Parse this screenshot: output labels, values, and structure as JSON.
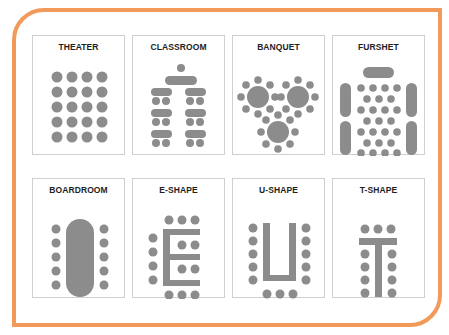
{
  "diagram": {
    "colors": {
      "frame": "#f19a5a",
      "shape": "#8c8c8c",
      "panel_border": "#cfcfcf",
      "title": "#1e1e1e"
    },
    "panels": [
      {
        "id": "theater",
        "title": "THEATER"
      },
      {
        "id": "classroom",
        "title": "CLASSROOM"
      },
      {
        "id": "banquet",
        "title": "BANQUET"
      },
      {
        "id": "furshet",
        "title": "FURSHET"
      },
      {
        "id": "boardroom",
        "title": "BOARDROOM"
      },
      {
        "id": "e-shape",
        "title": "E-SHAPE"
      },
      {
        "id": "u-shape",
        "title": "U-SHAPE"
      },
      {
        "id": "t-shape",
        "title": "T-SHAPE"
      }
    ]
  }
}
